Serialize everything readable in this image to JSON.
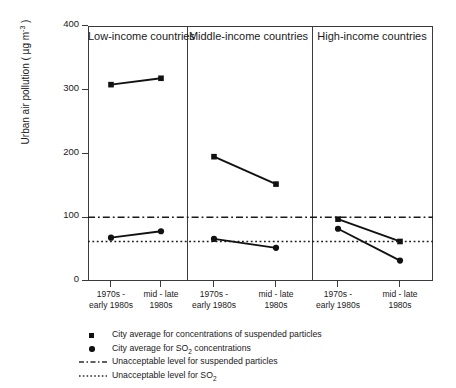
{
  "chart_data": {
    "type": "line",
    "title": "",
    "xlabel": "",
    "ylabel": "Urban air pollution ( µg m",
    "ylabel_exponent": "-3",
    "ylabel_tail": " )",
    "ylim": [
      0,
      400
    ],
    "yticks": [
      400,
      300,
      200,
      100,
      0
    ],
    "grid": false,
    "legend_position": "below-plot",
    "x": [
      "1970s -\nearly 1980s",
      "mid - late\n1980s"
    ],
    "xtick_labels": [
      {
        "line1": "1970s -",
        "line2": "early 1980s"
      },
      {
        "line1": "mid - late",
        "line2": "1980s"
      }
    ],
    "panels": [
      {
        "title": "Low-income countries",
        "series": [
          {
            "name": "City average for concentrations of suspended particles",
            "marker": "square",
            "values": [
              308,
              318
            ]
          },
          {
            "name": "City average for SO2 concentrations",
            "marker": "circle",
            "values": [
              68,
              78
            ]
          }
        ]
      },
      {
        "title": "Middle-income countries",
        "series": [
          {
            "name": "City average for concentrations of suspended particles",
            "marker": "square",
            "values": [
              195,
              152
            ]
          },
          {
            "name": "City average for SO2 concentrations",
            "marker": "circle",
            "values": [
              66,
              52
            ]
          }
        ]
      },
      {
        "title": "High-income countries",
        "series": [
          {
            "name": "City average for concentrations of suspended particles",
            "marker": "square",
            "values": [
              97,
              62
            ]
          },
          {
            "name": "City average for SO2 concentrations",
            "marker": "circle",
            "values": [
              82,
              32
            ]
          }
        ]
      }
    ],
    "reference_lines": [
      {
        "label": "Unacceptable level for suspended particles",
        "value": 100,
        "style": "dash-dot"
      },
      {
        "label": "Unacceptable level for SO2",
        "value": 62,
        "style": "dotted"
      }
    ],
    "legend": [
      {
        "key": "square-marker",
        "label_pre": "City average for concentrations of suspended particles",
        "label_sub": "",
        "label_post": ""
      },
      {
        "key": "circle-marker",
        "label_pre": "City average for SO",
        "label_sub": "2",
        "label_post": " concentrations"
      },
      {
        "key": "dash-dot-line",
        "label_pre": "Unacceptable level for suspended particles",
        "label_sub": "",
        "label_post": ""
      },
      {
        "key": "dotted-line",
        "label_pre": "Unacceptable level for SO",
        "label_sub": "2",
        "label_post": ""
      }
    ],
    "colors": {
      "ink": "#1a1a1a",
      "marker": "#111111",
      "axis": "#3a3a3a"
    }
  },
  "yticks": {
    "t0": "400",
    "t1": "300",
    "t2": "200",
    "t3": "100",
    "t4": "0"
  },
  "panel_titles": {
    "p0": "Low-income countries",
    "p1": "Middle-income countries",
    "p2": "High-income countries"
  },
  "xlabels": {
    "a1": "1970s -",
    "a2": "early 1980s",
    "b1": "mid - late",
    "b2": "1980s"
  },
  "ylabel": {
    "head": "Urban air pollution ( µg m",
    "exp": "-3",
    "tail": " )"
  },
  "legend_text": {
    "l0": "City average for concentrations of suspended particles",
    "l1a": "City average for SO",
    "l1b": "2",
    "l1c": " concentrations",
    "l2": "Unacceptable level for suspended particles",
    "l3a": "Unacceptable level for SO",
    "l3b": "2"
  }
}
